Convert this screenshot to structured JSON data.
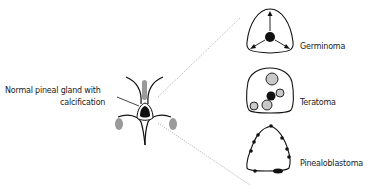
{
  "diagram": {
    "main_label": {
      "line1": "Normal pineal gland with",
      "line2": "calcification"
    },
    "tumors": [
      {
        "name": "Germinoma",
        "pattern": "central calcification, engulfed"
      },
      {
        "name": "Teratoma",
        "pattern": "multiple calcifications"
      },
      {
        "name": "Pinealoblastoma",
        "pattern": "peripheral exploded calcifications"
      }
    ],
    "colors": {
      "stroke": "#111111",
      "gray_fill": "#9a9a9a",
      "light_fill": "#c8c8c8",
      "dotted_line": "#999999"
    }
  }
}
